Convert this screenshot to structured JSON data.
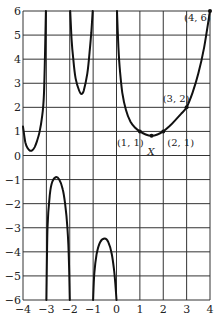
{
  "chart_data": {
    "type": "line",
    "title": "",
    "xlabel": "",
    "ylabel": "",
    "xlim": [
      -4,
      4
    ],
    "ylim": [
      -6,
      6
    ],
    "grid": true,
    "x_ticks": [
      "−4",
      "−3",
      "−2",
      "−1",
      "0",
      "1",
      "2",
      "3",
      "4"
    ],
    "y_ticks": [
      "6",
      "5",
      "4",
      "3",
      "2",
      "1",
      "0",
      "−1",
      "−2",
      "−3",
      "−4",
      "−5",
      "−6"
    ],
    "vertical_asymptotes": [
      -3,
      -2,
      -1,
      0
    ],
    "series": [
      {
        "name": "branch-1",
        "x": [
          -4,
          -3.9,
          -3.8,
          -3.7,
          -3.6,
          -3.5,
          -3.4,
          -3.3,
          -3.2,
          -3.1,
          -3.02
        ],
        "y": [
          1.2,
          0.55,
          0.3,
          0.2,
          0.22,
          0.35,
          0.6,
          0.95,
          1.5,
          2.6,
          6
        ]
      },
      {
        "name": "branch-2",
        "x": [
          -3.0,
          -2.95,
          -2.85,
          -2.75,
          -2.6,
          -2.45,
          -2.3,
          -2.2,
          -2.1,
          -2.03,
          -2.0
        ],
        "y": [
          -6,
          -3,
          -1.6,
          -1.1,
          -0.9,
          -1.0,
          -1.4,
          -2.0,
          -3.0,
          -4.5,
          -6
        ]
      },
      {
        "name": "branch-3",
        "x": [
          -1.98,
          -1.92,
          -1.85,
          -1.75,
          -1.6,
          -1.5,
          -1.4,
          -1.25,
          -1.15,
          -1.08,
          -1.02
        ],
        "y": [
          6,
          4.8,
          4.0,
          3.2,
          2.7,
          2.55,
          2.7,
          3.4,
          4.3,
          5.1,
          6
        ]
      },
      {
        "name": "branch-4",
        "x": [
          -1.0,
          -0.95,
          -0.85,
          -0.7,
          -0.5,
          -0.35,
          -0.2,
          -0.1,
          -0.05,
          0.0
        ],
        "y": [
          -6,
          -4.9,
          -4.1,
          -3.6,
          -3.45,
          -3.6,
          -4.1,
          -4.8,
          -5.3,
          -6
        ]
      },
      {
        "name": "branch-5",
        "x": [
          0.02,
          0.08,
          0.15,
          0.25,
          0.4,
          0.6,
          0.8,
          1.0,
          1.25,
          1.5,
          1.75,
          2.0,
          2.25,
          2.5,
          2.75,
          3.0,
          3.25,
          3.5,
          3.75,
          4.0
        ],
        "y": [
          6,
          4.5,
          3.5,
          2.6,
          1.9,
          1.4,
          1.15,
          1.0,
          0.87,
          0.82,
          0.87,
          1.0,
          1.2,
          1.45,
          1.72,
          2.0,
          2.6,
          3.4,
          4.5,
          6
        ]
      }
    ],
    "annotations": [
      {
        "label": "(1, 1)",
        "x": 1,
        "y": 1
      },
      {
        "label": "X",
        "x": 1.5,
        "y": 0.82
      },
      {
        "label": "(2, 1)",
        "x": 2,
        "y": 1
      },
      {
        "label": "(3, 2)",
        "x": 3,
        "y": 2
      },
      {
        "label": "(4, 6)",
        "x": 4,
        "y": 6
      }
    ]
  }
}
